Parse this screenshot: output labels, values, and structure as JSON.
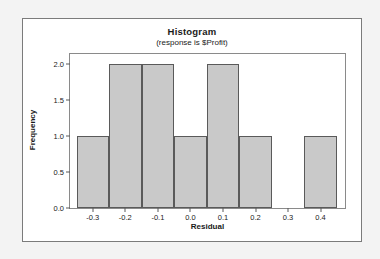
{
  "chart_data": {
    "type": "bar",
    "title": "Histogram",
    "subtitle": "(response is $Profit)",
    "xlabel": "Residual",
    "ylabel": "Frequency",
    "categories": [
      "-0.3",
      "-0.2",
      "-0.1",
      "0.0",
      "0.1",
      "0.2",
      "0.3",
      "0.4"
    ],
    "values": [
      1,
      2,
      2,
      1,
      2,
      1,
      0,
      1
    ],
    "bin_width": 0.1,
    "bin_edges": [
      -0.35,
      -0.25,
      -0.15,
      -0.05,
      0.05,
      0.15,
      0.25,
      0.35,
      0.45
    ],
    "xlim": [
      -0.37,
      0.475
    ],
    "ylim": [
      0,
      2.14
    ],
    "xticks": [
      "-0.3",
      "-0.2",
      "-0.1",
      "0.0",
      "0.1",
      "0.2",
      "0.3",
      "0.4"
    ],
    "xtick_values": [
      -0.3,
      -0.2,
      -0.1,
      0.0,
      0.1,
      0.2,
      0.3,
      0.4
    ],
    "yticks": [
      "0.0",
      "0.5",
      "1.0",
      "1.5",
      "2.0"
    ],
    "ytick_values": [
      0.0,
      0.5,
      1.0,
      1.5,
      2.0
    ],
    "grid": false,
    "legend": false,
    "bar_fill": "#c9c9c9",
    "bar_stroke": "#5a5a5a",
    "panel_background": "#ffffff",
    "figure_background": "#ffffff",
    "page_background": "#f3f3f3"
  }
}
